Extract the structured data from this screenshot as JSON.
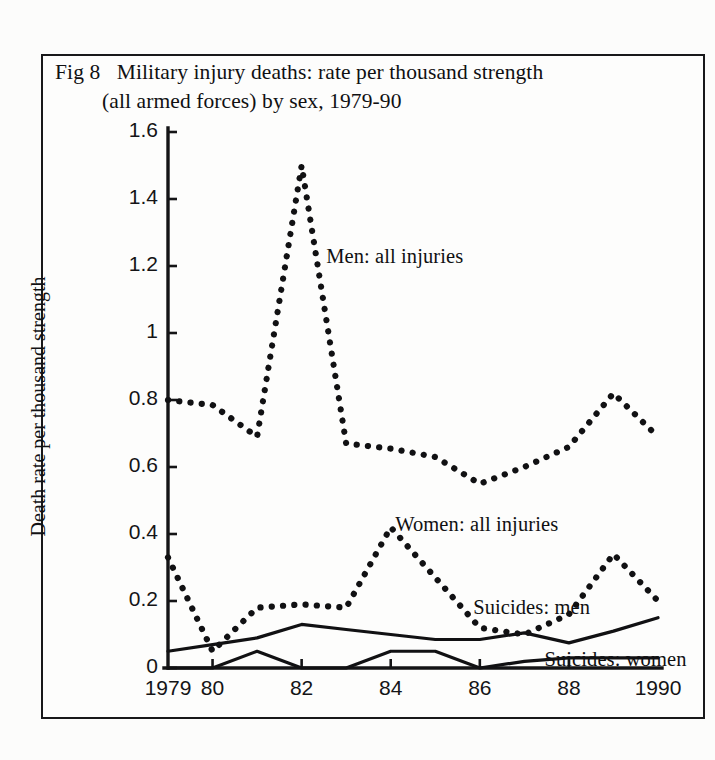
{
  "figure": {
    "title_line1": "Fig 8   Military injury deaths: rate per thousand strength",
    "title_line2": "(all armed forces) by sex, 1979-90",
    "frame_color": "#18181a",
    "background_color": "#fdfdfc",
    "ink_color": "#101012"
  },
  "chart_data": {
    "type": "line",
    "title": "Fig 8   Military injury deaths: rate per thousand strength (all armed forces) by sex, 1979-90",
    "xlabel": "",
    "ylabel": "Death rate per thousand strength",
    "x": [
      1979,
      1980,
      1981,
      1982,
      1983,
      1984,
      1985,
      1986,
      1987,
      1988,
      1989,
      1990
    ],
    "xtick_labels": [
      "1979",
      "80",
      "",
      "82",
      "",
      "84",
      "",
      "86",
      "",
      "88",
      "",
      "1990"
    ],
    "xlim": [
      1979,
      1990
    ],
    "ylim": [
      0,
      1.6
    ],
    "ytick_labels": [
      "0",
      "0.2",
      "0.4",
      "0.6",
      "0.8",
      "1",
      "1.2",
      "1.4",
      "1.6"
    ],
    "ytick_values": [
      0,
      0.2,
      0.4,
      0.6,
      0.8,
      1.0,
      1.2,
      1.4,
      1.6
    ],
    "grid": false,
    "legend": "inline-annotations",
    "series": [
      {
        "name": "Men: all injuries",
        "style": "dotted",
        "values": [
          0.8,
          0.785,
          0.69,
          1.5,
          0.67,
          0.655,
          0.63,
          0.55,
          0.6,
          0.66,
          0.82,
          0.69
        ]
      },
      {
        "name": "Women: all injuries",
        "style": "dotted",
        "values": [
          0.33,
          0.05,
          0.18,
          0.19,
          0.18,
          0.42,
          0.27,
          0.12,
          0.1,
          0.16,
          0.34,
          0.2
        ]
      },
      {
        "name": "Suicides: men",
        "style": "solid",
        "values": [
          0.05,
          0.07,
          0.09,
          0.13,
          0.115,
          0.1,
          0.085,
          0.085,
          0.105,
          0.075,
          0.11,
          0.15
        ]
      },
      {
        "name": "Suicides: women",
        "style": "solid",
        "values": [
          0.0,
          0.0,
          0.05,
          0.0,
          0.0,
          0.05,
          0.05,
          0.0,
          0.02,
          0.03,
          0.03,
          0.03
        ]
      }
    ],
    "annotations": [
      {
        "text": "Men: all injuries",
        "x": 1982.55,
        "y": 1.225
      },
      {
        "text": "Women: all injuries",
        "x": 1984.1,
        "y": 0.425
      },
      {
        "text": "Suicides: men",
        "x": 1985.85,
        "y": 0.175
      },
      {
        "text": "Suicides: women",
        "x": 1987.45,
        "y": 0.022
      }
    ]
  }
}
